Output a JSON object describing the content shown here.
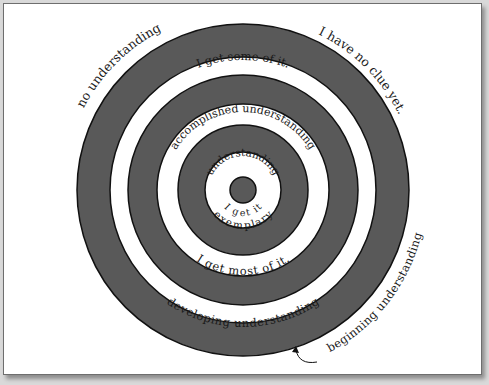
{
  "diagram": {
    "type": "concentric-target",
    "colors": {
      "dark_ring": "#595959",
      "light_ring": "#ffffff",
      "stroke": "#111111",
      "background": "#ffffff"
    },
    "rings": [
      {
        "level": "beginning",
        "inside_label": "I have no clue yet.",
        "outside_label": "no understanding",
        "ring_label": "beginning understanding"
      },
      {
        "level": "developing",
        "inside_label": "I get some of it.",
        "ring_label": "developing understanding"
      },
      {
        "level": "accomplished",
        "inside_label": "I get most of it.",
        "ring_label": "accomplished understanding"
      },
      {
        "level": "exemplary",
        "inside_label": "I get it",
        "ring_label": "exemplary understanding"
      }
    ],
    "labels": {
      "no_understanding": "no understanding",
      "no_clue": "I have no clue yet.",
      "some_of_it": "I get some of it.",
      "accomplished": "accomplished understanding",
      "understanding": "understanding",
      "get_it": "I get it",
      "exemplary": "exemplary",
      "most_of_it": "I get most of it.",
      "developing": "developing understanding",
      "beginning": "beginning understanding"
    },
    "pointer_arrow": "curved-arrow-to-outer-ring"
  }
}
